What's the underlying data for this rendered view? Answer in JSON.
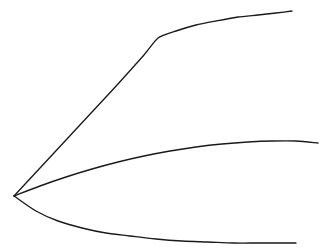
{
  "figure": {
    "title": "",
    "width": 327,
    "height": 251,
    "background_color": "#ffffff",
    "has_axes": false,
    "has_gridlines": false,
    "has_legend": false,
    "has_tick_labels": false,
    "has_text": false,
    "style": "hand-drawn pen sketch",
    "origin_label": "",
    "origin_x": 14,
    "origin_y": 196
  },
  "chart_data": {
    "type": "line",
    "title": "",
    "subtitle": "",
    "xlabel": "",
    "ylabel": "",
    "xlim": [
      0,
      327
    ],
    "ylim": [
      251,
      0
    ],
    "grid": false,
    "legend": false,
    "legend_position": "none",
    "annotations": [],
    "xticks": [],
    "yticks": [],
    "xticklabels": [],
    "yticklabels": [],
    "shared_origin": [
      14,
      196
    ],
    "series": [
      {
        "name": "upper-curve",
        "color": "#1a1a1a",
        "stroke_width": 1.35,
        "description": "steep near-linear rise from origin to a sharp knee, then flattens concave-down toward the top right",
        "knee": [
          158,
          38
        ],
        "end": [
          292,
          11
        ],
        "x": [
          14,
          40,
          66,
          92,
          118,
          144,
          158,
          176,
          196,
          216,
          238,
          258,
          276,
          292
        ],
        "y": [
          196,
          168,
          140,
          112,
          84,
          55,
          38,
          31,
          25,
          21,
          17,
          15,
          13,
          11
        ]
      },
      {
        "name": "middle-curve",
        "color": "#1a1a1a",
        "stroke_width": 1.35,
        "description": "gentle concave-down arc rising slowly from the origin and flattening to the right edge",
        "end": [
          318,
          143
        ],
        "x": [
          14,
          40,
          66,
          92,
          118,
          144,
          170,
          196,
          222,
          248,
          272,
          296,
          318
        ],
        "y": [
          196,
          186,
          177,
          169,
          162,
          156,
          151,
          147,
          144,
          142,
          141,
          141,
          143
        ]
      },
      {
        "name": "lower-curve",
        "color": "#1a1a1a",
        "stroke_width": 1.35,
        "description": "descends steeply from the origin, bows downward and flattens to a shallow minimum before the right end",
        "end": [
          296,
          243
        ],
        "x": [
          14,
          36,
          58,
          82,
          106,
          130,
          156,
          182,
          208,
          234,
          258,
          278,
          296
        ],
        "y": [
          196,
          211,
          221,
          228,
          233,
          236,
          239,
          241,
          242,
          243,
          243,
          243,
          243
        ]
      }
    ]
  }
}
